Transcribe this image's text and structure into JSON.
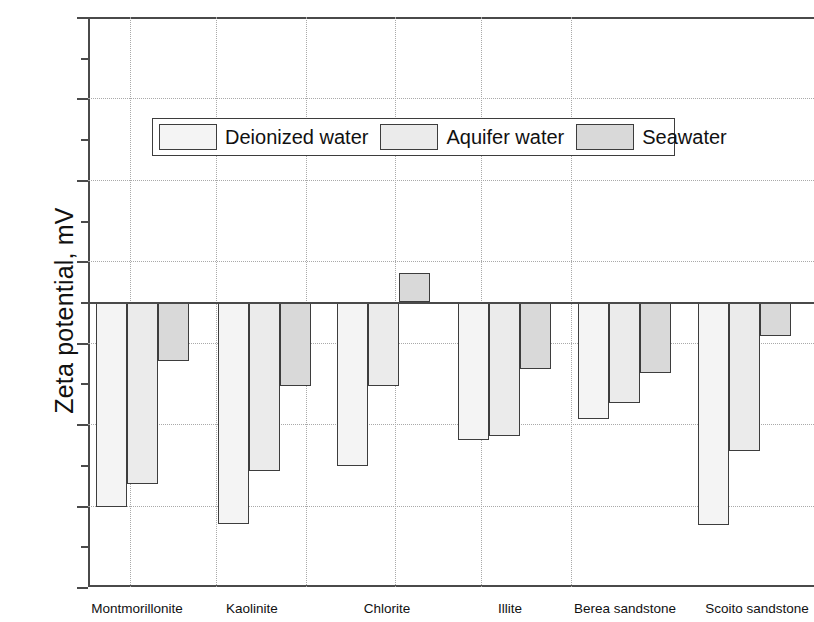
{
  "chart_data": {
    "type": "bar",
    "title": "",
    "xlabel": "",
    "ylabel": "Zeta potential, mV",
    "ylim": [
      -35,
      35
    ],
    "ytick_labels": [
      "35",
      "25",
      "15",
      "5",
      "-5",
      "-15",
      "-25",
      "-35"
    ],
    "ytick_values": [
      35,
      25,
      15,
      5,
      -5,
      -15,
      -25,
      -35
    ],
    "yminor_values": [
      30,
      20,
      10,
      0,
      -10,
      -20,
      -30
    ],
    "grid": "horizontal-and-vertical-dotted",
    "legend_position": "upper-center-inside",
    "categories": [
      "Montmorillonite",
      "Kaolinite",
      "Chlorite",
      "Illite",
      "Berea sandstone",
      "Scoito sandstone"
    ],
    "series": [
      {
        "name": "Deionized water",
        "color": "#f4f4f4",
        "values": [
          -25.2,
          -27.3,
          -20.2,
          -17.0,
          -14.4,
          -27.4
        ]
      },
      {
        "name": "Aquifer water",
        "color": "#ebebeb",
        "values": [
          -22.3,
          -20.7,
          -10.3,
          -16.4,
          -12.4,
          -18.3
        ]
      },
      {
        "name": "Seawater",
        "color": "#d9d9d9",
        "values": [
          -7.3,
          -10.3,
          3.6,
          -8.2,
          -8.7,
          -4.2
        ]
      }
    ]
  },
  "legend": {
    "items": [
      {
        "label": "Deionized water"
      },
      {
        "label": "Aquifer water"
      },
      {
        "label": "Seawater"
      }
    ]
  }
}
